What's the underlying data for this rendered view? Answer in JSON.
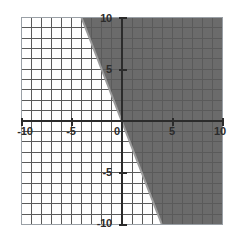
{
  "figure": {
    "name": "coordinate-plane-inequality",
    "background_color": "#ffffff"
  },
  "chart_data": {
    "type": "line",
    "title": "",
    "subtitle": "",
    "xlabel": "",
    "ylabel": "",
    "xlim": [
      -10,
      10
    ],
    "ylim": [
      -10,
      10
    ],
    "grid": true,
    "grid_step": 1,
    "legend": null,
    "legend_position": "none",
    "x_ticks": [
      -10,
      -5,
      0,
      5,
      10
    ],
    "y_ticks": [
      -10,
      -5,
      0,
      5,
      10
    ],
    "x_tick_labels": [
      "-10",
      "-5",
      "0",
      "5",
      "10"
    ],
    "y_tick_labels": [
      "-10",
      "-5",
      "0",
      "5",
      "10"
    ],
    "series": [
      {
        "name": "boundary-line",
        "type": "line",
        "style": "solid",
        "color": "#9b9b9b",
        "slope": -2.5,
        "intercept": 0,
        "equation": "y = -2.5x",
        "points": [
          {
            "x": -4,
            "y": 10
          },
          {
            "x": 0,
            "y": 0
          },
          {
            "x": 4,
            "y": -10
          }
        ]
      }
    ],
    "shaded_regions": [
      {
        "name": "solution-region",
        "description": "region to the right of and below the boundary line",
        "relation": "y <= -2.5x",
        "fill_color": "#6b6b6b",
        "opacity": 1,
        "polygon": [
          {
            "x": -4,
            "y": 10
          },
          {
            "x": 10,
            "y": 10
          },
          {
            "x": 10,
            "y": -10
          },
          {
            "x": 4,
            "y": -10
          }
        ]
      }
    ],
    "axis_color": "#2b2b2b",
    "grid_color_light": "#c9ccd1",
    "grid_color_dark": "#5a5a5a",
    "frame_color": "#9aa0a6"
  },
  "labels": {
    "x": [
      {
        "text": "-10",
        "value": -10
      },
      {
        "text": "-5",
        "value": -5
      },
      {
        "text": "0",
        "value": 0
      },
      {
        "text": "5",
        "value": 5
      },
      {
        "text": "10",
        "value": 10
      }
    ],
    "y": [
      {
        "text": "10",
        "value": 10
      },
      {
        "text": "5",
        "value": 5
      },
      {
        "text": "-5",
        "value": -5
      },
      {
        "text": "-10",
        "value": -10
      }
    ]
  }
}
